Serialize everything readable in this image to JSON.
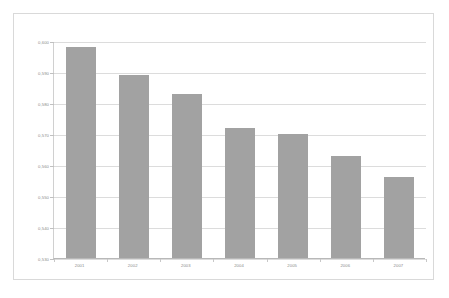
{
  "chart_data": {
    "type": "bar",
    "title": "",
    "subtitle": "",
    "xlabel": "",
    "ylabel": "",
    "categories": [
      "2001",
      "2002",
      "2003",
      "2004",
      "2005",
      "2006",
      "2007"
    ],
    "values": [
      0.598,
      0.589,
      0.583,
      0.572,
      0.57,
      0.563,
      0.556
    ],
    "value_labels": [
      "0,598",
      "0,589",
      "0,583",
      "0,572",
      "0,570",
      "0,563",
      "0,556"
    ],
    "ylim": [
      0.53,
      0.6
    ],
    "ytick_values": [
      0.6,
      0.59,
      0.58,
      0.57,
      0.56,
      0.55,
      0.54,
      0.53
    ],
    "ytick_labels": [
      "0,600",
      "0,590",
      "0,580",
      "0,570",
      "0,560",
      "0,550",
      "0,540",
      "0,530"
    ],
    "decimal_separator": ",",
    "grid": true,
    "grid_axis": "y",
    "legend": false,
    "legend_position": "none",
    "series": [
      {
        "name": "",
        "values": [
          0.598,
          0.589,
          0.583,
          0.572,
          0.57,
          0.563,
          0.556
        ],
        "color": "#a2a2a2"
      }
    ]
  },
  "style": {
    "bar_color": "#a2a2a2",
    "gridline_color": "#dcdcdc",
    "axis_color": "#b8b8b8",
    "frame_color": "#d9d9d9",
    "label_color": "#8a8a8a",
    "background": "#ffffff"
  }
}
